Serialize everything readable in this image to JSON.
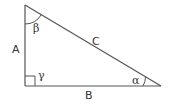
{
  "diagram": {
    "type": "right-triangle",
    "colors": {
      "stroke": "#555555",
      "text": "#333333",
      "background": "#ffffff"
    },
    "sides": {
      "a": "A",
      "b": "B",
      "c": "C"
    },
    "angles": {
      "alpha": "α",
      "beta": "β",
      "gamma": "γ"
    }
  }
}
